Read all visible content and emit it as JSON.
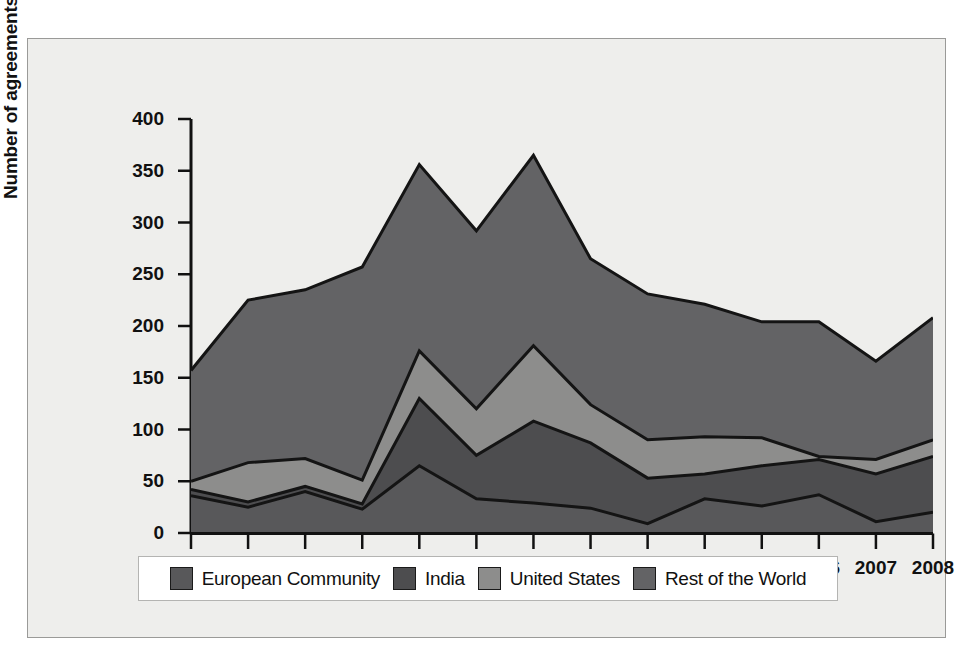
{
  "chart_data": {
    "type": "area",
    "title": "",
    "xlabel": "",
    "ylabel": "Number of agreements",
    "stacked": true,
    "grid": false,
    "legend_position": "bottom",
    "ylim": [
      0,
      400
    ],
    "yticks": [
      0,
      50,
      100,
      150,
      200,
      250,
      300,
      350,
      400
    ],
    "categories": [
      "1995",
      "1996",
      "1997",
      "1998",
      "1999",
      "2000",
      "2001",
      "2002",
      "2003",
      "2004",
      "2005",
      "2006",
      "2007",
      "2008"
    ],
    "series": [
      {
        "name": "European Community",
        "color": "#58585a",
        "values": [
          36,
          25,
          40,
          23,
          65,
          33,
          29,
          24,
          9,
          33,
          26,
          37,
          11,
          20
        ]
      },
      {
        "name": "India",
        "color": "#4d4d4f",
        "values": [
          6,
          5,
          5,
          5,
          65,
          42,
          79,
          63,
          44,
          24,
          39,
          34,
          46,
          54
        ]
      },
      {
        "name": "United States",
        "color": "#8d8d8c",
        "values": [
          8,
          38,
          27,
          23,
          46,
          45,
          73,
          37,
          37,
          36,
          27,
          3,
          14,
          16
        ]
      },
      {
        "name": "Rest of the World",
        "color": "#636365",
        "values": [
          107,
          157,
          163,
          206,
          180,
          172,
          184,
          141,
          141,
          128,
          112,
          130,
          95,
          118
        ]
      }
    ],
    "totals": [
      157,
      225,
      235,
      257,
      356,
      292,
      365,
      265,
      231,
      221,
      204,
      204,
      166,
      208
    ],
    "cumulative": {
      "ec": [
        36,
        25,
        40,
        23,
        65,
        33,
        29,
        24,
        9,
        33,
        26,
        37,
        11,
        20
      ],
      "ec_india": [
        42,
        30,
        45,
        28,
        130,
        75,
        108,
        87,
        53,
        57,
        65,
        71,
        57,
        74
      ],
      "ec_india_us": [
        50,
        68,
        72,
        51,
        176,
        120,
        181,
        124,
        90,
        93,
        92,
        74,
        71,
        90
      ],
      "total": [
        157,
        225,
        235,
        257,
        356,
        292,
        365,
        265,
        231,
        221,
        204,
        204,
        166,
        208
      ]
    }
  },
  "axis": {
    "y_title": "Number of agreements",
    "y_ticks": [
      "400",
      "350",
      "300",
      "250",
      "200",
      "150",
      "100",
      "50",
      "0"
    ],
    "x_ticks": [
      "1995",
      "1996",
      "1997",
      "1998",
      "1999",
      "2000",
      "2001",
      "2002",
      "2003",
      "2004",
      "2005",
      "2006",
      "2007",
      "2008"
    ]
  },
  "legend": {
    "entries": [
      {
        "label": "European Community",
        "color": "#58585a"
      },
      {
        "label": "India",
        "color": "#4d4d4f"
      },
      {
        "label": "United States",
        "color": "#8d8d8c"
      },
      {
        "label": "Rest of the World",
        "color": "#636365"
      }
    ]
  },
  "colors": {
    "panel_background": "#eeeeec",
    "panel_border": "#9a9a98",
    "axis": "#111111",
    "outline": "#1a1a1a",
    "legend_background": "#ffffff"
  }
}
